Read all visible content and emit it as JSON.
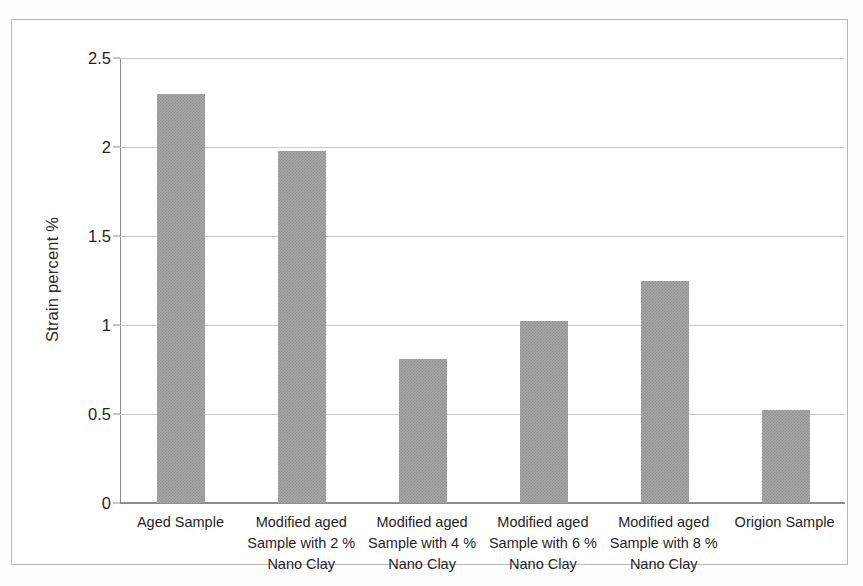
{
  "chart_data": {
    "type": "bar",
    "title": "",
    "xlabel": "",
    "ylabel": "Strain percent %",
    "ylim": [
      0,
      2.5
    ],
    "ytick_labels": [
      "0",
      "0.5",
      "1",
      "1.5",
      "2",
      "2.5"
    ],
    "ytick_values": [
      0,
      0.5,
      1,
      1.5,
      2,
      2.5
    ],
    "grid": true,
    "legend": "none",
    "bar_color": "#a8a8a8",
    "categories": [
      "Aged Sample",
      "Modified aged Sample with 2 % Nano Clay",
      "Modified aged Sample with 4 % Nano Clay",
      "Modified aged Sample with 6 % Nano Clay",
      "Modified aged Sample with 8 % Nano Clay",
      "Origion Sample"
    ],
    "category_lines": [
      [
        "Aged Sample"
      ],
      [
        "Modified aged",
        "Sample with 2 %",
        "Nano Clay"
      ],
      [
        "Modified aged",
        "Sample with 4 %",
        "Nano Clay"
      ],
      [
        "Modified aged",
        "Sample with 6 %",
        "Nano Clay"
      ],
      [
        "Modified aged",
        "Sample with 8 %",
        "Nano Clay"
      ],
      [
        "Origion Sample"
      ]
    ],
    "values": [
      2.3,
      1.98,
      0.81,
      1.02,
      1.25,
      0.52
    ]
  }
}
